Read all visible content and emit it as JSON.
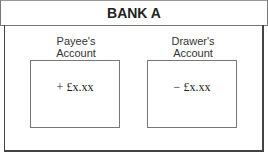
{
  "header": {
    "title": "BANK A"
  },
  "accounts": [
    {
      "label_line1": "Payee's",
      "label_line2": "Account",
      "amount": "+ £x.xx"
    },
    {
      "label_line1": "Drawer's",
      "label_line2": "Account",
      "amount": "− £x.xx"
    }
  ]
}
